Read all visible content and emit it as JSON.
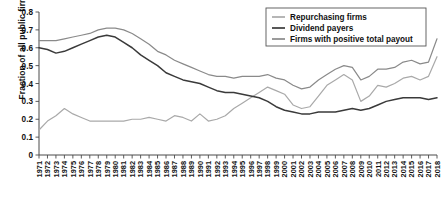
{
  "chart_data": {
    "type": "line",
    "title": "",
    "xlabel": "",
    "ylabel": "Fraction of all public firms",
    "ylim": [
      0,
      0.8
    ],
    "ytick_values": [
      0,
      0.1,
      0.2,
      0.3,
      0.4,
      0.5,
      0.6,
      0.7,
      0.8
    ],
    "ytick_labels": [
      "0",
      "0.1",
      "0.2",
      "0.3",
      "0.4",
      "0.5",
      "0.6",
      "0.7",
      "0.8"
    ],
    "grid": false,
    "legend_position": "top-right",
    "x": [
      1971,
      1972,
      1973,
      1974,
      1975,
      1976,
      1977,
      1978,
      1979,
      1980,
      1981,
      1982,
      1983,
      1984,
      1985,
      1986,
      1987,
      1988,
      1989,
      1990,
      1991,
      1992,
      1993,
      1994,
      1995,
      1996,
      1997,
      1998,
      1999,
      2000,
      2001,
      2002,
      2003,
      2004,
      2005,
      2006,
      2007,
      2008,
      2009,
      2010,
      2011,
      2012,
      2013,
      2014,
      2015,
      2016,
      2017,
      2018
    ],
    "series": [
      {
        "name": "Repurchasing firms",
        "color": "#a9a9a9",
        "values": [
          0.14,
          0.19,
          0.22,
          0.26,
          0.23,
          0.21,
          0.19,
          0.19,
          0.19,
          0.19,
          0.19,
          0.2,
          0.2,
          0.21,
          0.2,
          0.19,
          0.22,
          0.21,
          0.19,
          0.23,
          0.19,
          0.2,
          0.22,
          0.26,
          0.29,
          0.32,
          0.35,
          0.38,
          0.36,
          0.34,
          0.28,
          0.26,
          0.27,
          0.33,
          0.39,
          0.42,
          0.45,
          0.42,
          0.3,
          0.33,
          0.39,
          0.38,
          0.4,
          0.43,
          0.44,
          0.42,
          0.44,
          0.55
        ]
      },
      {
        "name": "Dividend payers",
        "color": "#3a3a3a",
        "values": [
          0.6,
          0.59,
          0.57,
          0.58,
          0.6,
          0.62,
          0.64,
          0.66,
          0.67,
          0.66,
          0.63,
          0.6,
          0.56,
          0.53,
          0.5,
          0.46,
          0.44,
          0.42,
          0.41,
          0.4,
          0.38,
          0.36,
          0.35,
          0.35,
          0.34,
          0.33,
          0.32,
          0.3,
          0.27,
          0.25,
          0.24,
          0.23,
          0.23,
          0.24,
          0.24,
          0.24,
          0.25,
          0.26,
          0.25,
          0.26,
          0.28,
          0.3,
          0.31,
          0.32,
          0.32,
          0.32,
          0.31,
          0.32
        ]
      },
      {
        "name": "Firms with positive total payout",
        "color": "#8a8a8a",
        "values": [
          0.64,
          0.64,
          0.64,
          0.65,
          0.66,
          0.67,
          0.68,
          0.7,
          0.71,
          0.71,
          0.7,
          0.68,
          0.65,
          0.62,
          0.58,
          0.56,
          0.53,
          0.51,
          0.49,
          0.47,
          0.45,
          0.44,
          0.44,
          0.43,
          0.44,
          0.44,
          0.44,
          0.45,
          0.43,
          0.42,
          0.39,
          0.37,
          0.38,
          0.42,
          0.45,
          0.48,
          0.5,
          0.49,
          0.42,
          0.44,
          0.48,
          0.48,
          0.49,
          0.52,
          0.53,
          0.51,
          0.52,
          0.65
        ]
      }
    ]
  },
  "legend": {
    "items": [
      {
        "label": "Repurchasing firms"
      },
      {
        "label": "Dividend payers"
      },
      {
        "label": "Firms with positive total payout"
      }
    ]
  },
  "axis": {
    "y_title": "Fraction of all public firms"
  }
}
